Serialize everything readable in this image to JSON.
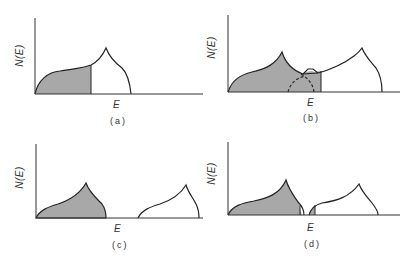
{
  "panels": [
    {
      "id": "a",
      "caption": "(a)",
      "ylabel": "N(E)",
      "xlabel": "E"
    },
    {
      "id": "b",
      "caption": "(b)",
      "ylabel": "N(E)",
      "xlabel": "E"
    },
    {
      "id": "c",
      "caption": "(c)",
      "ylabel": "N(E)",
      "xlabel": "E"
    },
    {
      "id": "d",
      "caption": "(d)",
      "ylabel": "N(E)",
      "xlabel": "E"
    }
  ],
  "colors": {
    "shade": "#a8a8a8",
    "line": "#222222"
  }
}
